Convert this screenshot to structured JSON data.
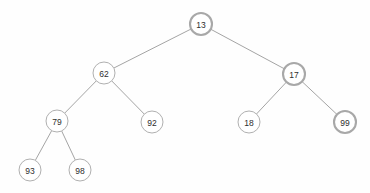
{
  "diagram": {
    "type": "binary-tree",
    "background_color": "#fefefe",
    "edge_color": "#9a9a9a",
    "node_fill": "#ffffff",
    "node_stroke": "#b0b0b0",
    "node_stroke_emphasis": "#a8a8a8",
    "label_color": "#2e2e2e",
    "node_radius": 11,
    "nodes": [
      {
        "id": "n13",
        "label": "13",
        "cx": 201,
        "cy": 24,
        "emphasis": true,
        "level": 0
      },
      {
        "id": "n62",
        "label": "62",
        "cx": 104,
        "cy": 73,
        "emphasis": false,
        "level": 1
      },
      {
        "id": "n17",
        "label": "17",
        "cx": 294,
        "cy": 74,
        "emphasis": true,
        "level": 1
      },
      {
        "id": "n79",
        "label": "79",
        "cx": 57,
        "cy": 121,
        "emphasis": false,
        "level": 2
      },
      {
        "id": "n92",
        "label": "92",
        "cx": 152,
        "cy": 122,
        "emphasis": false,
        "level": 2
      },
      {
        "id": "n18",
        "label": "18",
        "cx": 249,
        "cy": 122,
        "emphasis": false,
        "level": 2
      },
      {
        "id": "n99",
        "label": "99",
        "cx": 345,
        "cy": 122,
        "emphasis": true,
        "level": 2
      },
      {
        "id": "n93",
        "label": "93",
        "cx": 30,
        "cy": 170,
        "emphasis": false,
        "level": 3
      },
      {
        "id": "n98",
        "label": "98",
        "cx": 80,
        "cy": 170,
        "emphasis": false,
        "level": 3
      }
    ],
    "edges": [
      {
        "from": "n13",
        "to": "n62",
        "side": "left"
      },
      {
        "from": "n13",
        "to": "n17",
        "side": "right"
      },
      {
        "from": "n62",
        "to": "n79",
        "side": "left"
      },
      {
        "from": "n62",
        "to": "n92",
        "side": "right"
      },
      {
        "from": "n17",
        "to": "n18",
        "side": "left"
      },
      {
        "from": "n17",
        "to": "n99",
        "side": "right"
      },
      {
        "from": "n79",
        "to": "n93",
        "side": "left"
      },
      {
        "from": "n79",
        "to": "n98",
        "side": "right"
      }
    ]
  }
}
